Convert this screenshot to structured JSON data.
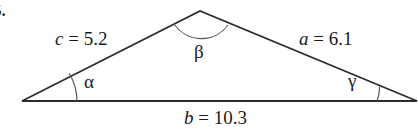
{
  "figure": {
    "problem_number": "5.",
    "background_color": "#ffffff",
    "stroke_color": "#2b2b2b",
    "text_color": "#1a1a1a",
    "width": 418,
    "height": 134
  },
  "triangle": {
    "vertices": {
      "left": {
        "x": 22,
        "y": 101
      },
      "apex": {
        "x": 200,
        "y": 11
      },
      "right": {
        "x": 417,
        "y": 101
      }
    }
  },
  "sides": [
    {
      "name": "side-c",
      "var": "c",
      "eq": " = ",
      "value": "5.2",
      "text": "c = 5.2"
    },
    {
      "name": "side-a",
      "var": "a",
      "eq": " = ",
      "value": "6.1",
      "text": "a = 6.1"
    },
    {
      "name": "side-b",
      "var": "b",
      "eq": " = ",
      "value": "10.3",
      "text": "b = 10.3"
    }
  ],
  "angles": [
    {
      "name": "angle-alpha",
      "symbol": "α",
      "vertex": "left"
    },
    {
      "name": "angle-beta",
      "symbol": "β",
      "vertex": "apex"
    },
    {
      "name": "angle-gamma",
      "symbol": "γ",
      "vertex": "right"
    }
  ]
}
